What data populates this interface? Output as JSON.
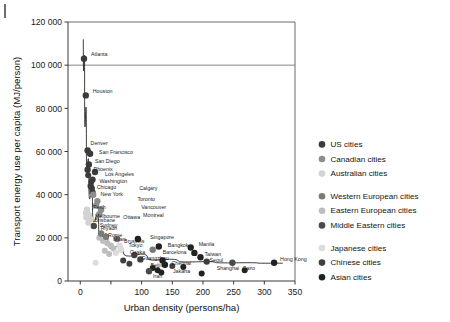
{
  "figure": {
    "margin_rule": "left-margin-rule"
  },
  "chart_data": {
    "type": "scatter",
    "title": "",
    "xlabel": "Urban density (persons/ha)",
    "ylabel": "Transport energy use per capita (MJ/person)",
    "xlim": [
      -20,
      350
    ],
    "ylim": [
      0,
      120000
    ],
    "xticks": [
      0,
      50,
      100,
      150,
      200,
      250,
      300,
      350
    ],
    "xticklabels": [
      "0",
      "",
      "100",
      "150",
      "200",
      "250",
      "300",
      "350"
    ],
    "yticks": [
      0,
      20000,
      40000,
      60000,
      80000,
      100000,
      120000
    ],
    "yticklabels": [
      "0",
      "20 000",
      "40 000",
      "60 000",
      "80 000",
      "100 000",
      "120 000"
    ],
    "grid": "horizontal-line-at-100000",
    "legend_position": "right",
    "colors": {
      "us": "#3b3b3b",
      "canadian": "#8d8d8d",
      "australian": "#d2d2d2",
      "western_european": "#7a7a7a",
      "eastern_european": "#bdbdbd",
      "middle_eastern": "#4a4a4a",
      "japanese": "#dcdcdc",
      "chinese": "#3f3f3f",
      "asian": "#222222"
    },
    "legend": [
      {
        "key": "us",
        "label": "US cities",
        "color": "#3b3b3b"
      },
      {
        "key": "canadian",
        "label": "Canadian cities",
        "color": "#8d8d8d"
      },
      {
        "key": "australian",
        "label": "Australian cities",
        "color": "#d2d2d2"
      },
      {
        "key": "western_european",
        "label": "Western European cities",
        "color": "#7a7a7a"
      },
      {
        "key": "eastern_european",
        "label": "Eastern European cities",
        "color": "#bdbdbd"
      },
      {
        "key": "middle_eastern",
        "label": "Middle Eastern cities",
        "color": "#4a4a4a"
      },
      {
        "key": "japanese",
        "label": "Japanese cities",
        "color": "#dcdcdc"
      },
      {
        "key": "chinese",
        "label": "Chinese cities",
        "color": "#3f3f3f"
      },
      {
        "key": "asian",
        "label": "Asian cities",
        "color": "#222222"
      }
    ],
    "points": [
      {
        "label": "Atlanta",
        "group": "us",
        "x": 6,
        "y": 103000,
        "lx": 7,
        "ly": -4
      },
      {
        "label": "Houston",
        "group": "us",
        "x": 9,
        "y": 86000,
        "lx": 7,
        "ly": -4
      },
      {
        "label": "Denver",
        "group": "us",
        "x": 12,
        "y": 60500,
        "lx": 3,
        "ly": -7
      },
      {
        "label": "San Francisco",
        "group": "us",
        "x": 16,
        "y": 59000,
        "lx": 9,
        "ly": -1
      },
      {
        "label": "San Diego",
        "group": "us",
        "x": 14,
        "y": 54000,
        "lx": 6,
        "ly": -3
      },
      {
        "label": "Phoenix",
        "group": "us",
        "x": 12,
        "y": 51500,
        "lx": 6,
        "ly": 0
      },
      {
        "label": "Los Angeles",
        "group": "us",
        "x": 24,
        "y": 50500,
        "lx": 10,
        "ly": 2
      },
      {
        "label": "Washington",
        "group": "us",
        "x": 20,
        "y": 47000,
        "lx": 7,
        "ly": 2
      },
      {
        "label": "Chicago",
        "group": "us",
        "x": 17,
        "y": 44000,
        "lx": 6,
        "ly": 1
      },
      {
        "label": "New York",
        "group": "us",
        "x": 20,
        "y": 41000,
        "lx": 8,
        "ly": 2
      },
      {
        "label": "Calgary",
        "group": "canadian",
        "x": 21,
        "y": 40000,
        "lx": 46,
        "ly": -6
      },
      {
        "label": "Toronto",
        "group": "canadian",
        "x": 28,
        "y": 37000,
        "lx": 40,
        "ly": -2
      },
      {
        "label": "Vancouver",
        "group": "canadian",
        "x": 26,
        "y": 35000,
        "lx": 45,
        "ly": 2
      },
      {
        "label": "Montreal",
        "group": "canadian",
        "x": 34,
        "y": 33000,
        "lx": 42,
        "ly": 6
      },
      {
        "label": "Ottawa",
        "group": "canadian",
        "x": 31,
        "y": 31000,
        "lx": 24,
        "ly": 3
      },
      {
        "label": "Perth",
        "group": "australian",
        "x": 11,
        "y": 33000,
        "lx": 6,
        "ly": -2
      },
      {
        "label": "Melbourne",
        "group": "australian",
        "x": 14,
        "y": 30500,
        "lx": 6,
        "ly": 1
      },
      {
        "label": "Brisbane",
        "group": "australian",
        "x": 10,
        "y": 29500,
        "lx": 8,
        "ly": 3
      },
      {
        "label": "Sydney",
        "group": "australian",
        "x": 17,
        "y": 28500,
        "lx": 9,
        "ly": 6
      },
      {
        "label": "Riyadh",
        "group": "middle_eastern",
        "x": 22,
        "y": 25500,
        "lx": 7,
        "ly": 2
      },
      {
        "label": "Rome",
        "group": "western_european",
        "x": 34,
        "y": 22000,
        "lx": 7,
        "ly": 2
      },
      {
        "label": "Milan",
        "group": "western_european",
        "x": 42,
        "y": 20500,
        "lx": 7,
        "ly": 3
      },
      {
        "label": "Brussels",
        "group": "western_european",
        "x": 60,
        "y": 19500,
        "lx": 7,
        "ly": 2
      },
      {
        "label": "Singapore",
        "group": "asian",
        "x": 94,
        "y": 19500,
        "lx": 12,
        "ly": -2
      },
      {
        "label": "Tokyo",
        "group": "japanese",
        "x": 64,
        "y": 16500,
        "lx": 9,
        "ly": 0
      },
      {
        "label": "Osaka",
        "group": "japanese",
        "x": 66,
        "y": 14500,
        "lx": 9,
        "ly": 3
      },
      {
        "label": "Bangkok",
        "group": "asian",
        "x": 128,
        "y": 16000,
        "lx": 9,
        "ly": -1
      },
      {
        "label": "Barcelona",
        "group": "western_european",
        "x": 118,
        "y": 14500,
        "lx": 10,
        "ly": 3
      },
      {
        "label": "Manila",
        "group": "asian",
        "x": 180,
        "y": 15500,
        "lx": 8,
        "ly": -3
      },
      {
        "label": "Taiwan",
        "group": "asian",
        "x": 186,
        "y": 13000,
        "lx": 10,
        "ly": 1
      },
      {
        "label": "Guangzhou",
        "group": "chinese",
        "x": 88,
        "y": 12000,
        "lx": 7,
        "ly": 3
      },
      {
        "label": "Beijing",
        "group": "chinese",
        "x": 98,
        "y": 10000,
        "lx": 10,
        "ly": 6
      },
      {
        "label": "Chennai",
        "group": "asian",
        "x": 134,
        "y": 9500,
        "lx": 9,
        "ly": 3
      },
      {
        "label": "Jakarta",
        "group": "asian",
        "x": 138,
        "y": 7500,
        "lx": 8,
        "ly": 7
      },
      {
        "label": "Seoul",
        "group": "asian",
        "x": 196,
        "y": 11000,
        "lx": 9,
        "ly": 3
      },
      {
        "label": "Shanghai",
        "group": "chinese",
        "x": 206,
        "y": 9000,
        "lx": 10,
        "ly": 7
      },
      {
        "label": "Cairo",
        "group": "middle_eastern",
        "x": 248,
        "y": 8500,
        "lx": 10,
        "ly": 6
      },
      {
        "label": "Hong Kong",
        "group": "asian",
        "x": 316,
        "y": 8500,
        "lx": 6,
        "ly": -3
      },
      {
        "label": "Iran",
        "group": "middle_eastern",
        "x": 112,
        "y": 4500,
        "lx": 4,
        "ly": 5
      }
    ],
    "unlabeled_points": [
      {
        "group": "us",
        "x": 13,
        "y": 49000
      },
      {
        "group": "us",
        "x": 18,
        "y": 46000
      },
      {
        "group": "us",
        "x": 19,
        "y": 43000
      },
      {
        "group": "australian",
        "x": 9,
        "y": 31500
      },
      {
        "group": "australian",
        "x": 13,
        "y": 27000
      },
      {
        "group": "eastern_european",
        "x": 31,
        "y": 20000
      },
      {
        "group": "eastern_european",
        "x": 37,
        "y": 18500
      },
      {
        "group": "eastern_european",
        "x": 44,
        "y": 17500
      },
      {
        "group": "eastern_european",
        "x": 50,
        "y": 16500
      },
      {
        "group": "eastern_european",
        "x": 54,
        "y": 15000
      },
      {
        "group": "eastern_european",
        "x": 40,
        "y": 14000
      },
      {
        "group": "eastern_european",
        "x": 47,
        "y": 12500
      },
      {
        "group": "japanese",
        "x": 58,
        "y": 13000
      },
      {
        "group": "japanese",
        "x": 25,
        "y": 8500
      },
      {
        "group": "chinese",
        "x": 70,
        "y": 9500
      },
      {
        "group": "chinese",
        "x": 80,
        "y": 8000
      },
      {
        "group": "asian",
        "x": 118,
        "y": 6000
      },
      {
        "group": "asian",
        "x": 126,
        "y": 5000
      },
      {
        "group": "asian",
        "x": 132,
        "y": 4000
      },
      {
        "group": "asian",
        "x": 168,
        "y": 6500
      },
      {
        "group": "asian",
        "x": 198,
        "y": 3500
      },
      {
        "group": "asian",
        "x": 268,
        "y": 5000
      },
      {
        "group": "chinese",
        "x": 150,
        "y": 7000
      }
    ],
    "trend_curve": [
      {
        "x": 5,
        "y": 112000
      },
      {
        "x": 7,
        "y": 90000
      },
      {
        "x": 10,
        "y": 62000
      },
      {
        "x": 14,
        "y": 46000
      },
      {
        "x": 20,
        "y": 34000
      },
      {
        "x": 30,
        "y": 24000
      },
      {
        "x": 45,
        "y": 18000
      },
      {
        "x": 70,
        "y": 13500
      },
      {
        "x": 110,
        "y": 10500
      },
      {
        "x": 160,
        "y": 9200
      },
      {
        "x": 220,
        "y": 8600
      },
      {
        "x": 290,
        "y": 8300
      },
      {
        "x": 330,
        "y": 8200
      }
    ]
  }
}
